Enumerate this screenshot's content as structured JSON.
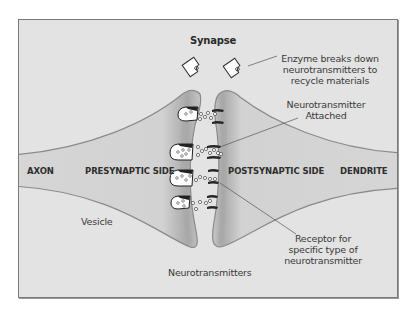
{
  "diagram": {
    "title": "Synapse",
    "colors": {
      "background": "#e3e3e3",
      "border": "#7a7a7a",
      "neuron_fill": "#cfcfcf",
      "neuron_edge": "#8c8c8c",
      "text": "#3a3a3a",
      "receptor": "#2a2a2a"
    },
    "regions": {
      "axon": "AXON",
      "presynaptic": "PRESYNAPTIC SIDE",
      "postsynaptic": "POSTSYNAPTIC SIDE",
      "dendrite": "DENDRITE"
    },
    "callouts": {
      "enzyme": [
        "Enzyme breaks down",
        "neurotransmitters to",
        "recycle materials"
      ],
      "attached": [
        "Neurotransmitter",
        "Attached"
      ],
      "receptor": [
        "Receptor for",
        "specific type of",
        "neurotransmitter"
      ],
      "vesicle": "Vesicle",
      "neurotransmitters": "Neurotransmitters"
    },
    "icons": [
      "enzyme-icon",
      "vesicle-icon",
      "receptor-icon",
      "neurotransmitter-dot-icon"
    ]
  }
}
